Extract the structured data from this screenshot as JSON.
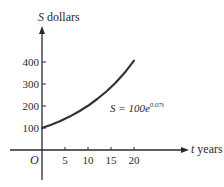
{
  "chart_data": {
    "type": "line",
    "title": "",
    "xlabel": "t years",
    "ylabel": "S dollars",
    "xlabel_var": "t",
    "xlabel_unit": "years",
    "ylabel_var": "S",
    "ylabel_unit": "dollars",
    "origin_label": "O",
    "x_ticks": [
      5,
      10,
      15,
      20
    ],
    "y_ticks": [
      100,
      200,
      300,
      400
    ],
    "xlim": [
      -8,
      28
    ],
    "ylim": [
      -70,
      480
    ],
    "grid": false,
    "annotation": {
      "lhs": "S = 100e",
      "exponent": "0.07t"
    },
    "series": [
      {
        "name": "S = 100e^(0.07t)",
        "x": [
          0,
          2,
          4,
          6,
          8,
          10,
          12,
          14,
          16,
          18,
          20
        ],
        "values": [
          100,
          115,
          132,
          152,
          175,
          201,
          232,
          266,
          306,
          352,
          406
        ]
      }
    ]
  }
}
